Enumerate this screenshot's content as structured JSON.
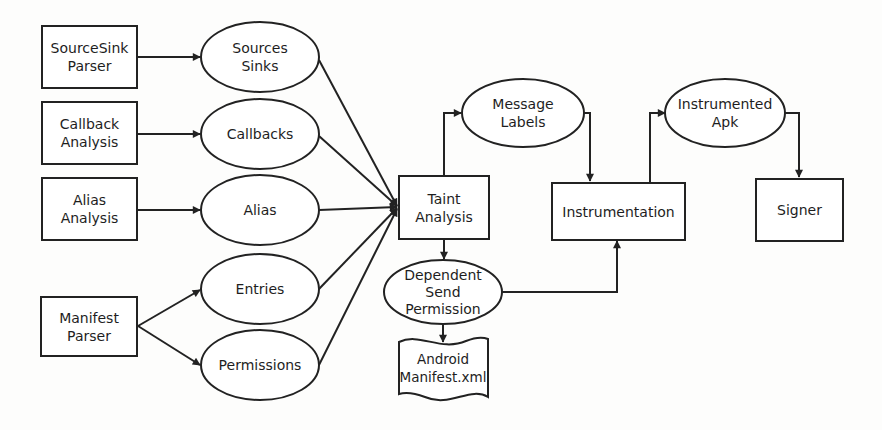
{
  "diagram": {
    "title": "",
    "colors": {
      "stroke": "#222222",
      "text": "#1e1e1e",
      "background": "#fdfdfc"
    },
    "nodes": {
      "sourcesink_parser": {
        "label": "SourceSink\nParser",
        "shape": "rectangle"
      },
      "callback_analysis": {
        "label": "Callback\nAnalysis",
        "shape": "rectangle"
      },
      "alias_analysis": {
        "label": "Alias\nAnalysis",
        "shape": "rectangle"
      },
      "manifest_parser": {
        "label": "Manifest\nParser",
        "shape": "rectangle"
      },
      "sources_sinks": {
        "label": "Sources\nSinks",
        "shape": "ellipse"
      },
      "callbacks": {
        "label": "Callbacks",
        "shape": "ellipse"
      },
      "alias": {
        "label": "Alias",
        "shape": "ellipse"
      },
      "entries": {
        "label": "Entries",
        "shape": "ellipse"
      },
      "permissions": {
        "label": "Permissions",
        "shape": "ellipse"
      },
      "taint_analysis": {
        "label": "Taint\nAnalysis",
        "shape": "rectangle"
      },
      "message_labels": {
        "label": "Message\nLabels",
        "shape": "ellipse"
      },
      "dependent_send_permission": {
        "label": "Dependent\nSend\nPermission",
        "shape": "ellipse"
      },
      "android_manifest": {
        "label": "Android\nManifest.xml",
        "shape": "document"
      },
      "instrumentation": {
        "label": "Instrumentation",
        "shape": "rectangle"
      },
      "instrumented_apk": {
        "label": "Instrumented\nApk",
        "shape": "ellipse"
      },
      "signer": {
        "label": "Signer",
        "shape": "rectangle"
      }
    },
    "edges": [
      {
        "from": "SourceSink Parser",
        "to": "Sources Sinks"
      },
      {
        "from": "Callback Analysis",
        "to": "Callbacks"
      },
      {
        "from": "Alias Analysis",
        "to": "Alias"
      },
      {
        "from": "Manifest Parser",
        "to": "Entries"
      },
      {
        "from": "Manifest Parser",
        "to": "Permissions"
      },
      {
        "from": "Sources Sinks",
        "to": "Taint Analysis"
      },
      {
        "from": "Callbacks",
        "to": "Taint Analysis"
      },
      {
        "from": "Alias",
        "to": "Taint Analysis"
      },
      {
        "from": "Entries",
        "to": "Taint Analysis"
      },
      {
        "from": "Permissions",
        "to": "Taint Analysis"
      },
      {
        "from": "Taint Analysis",
        "to": "Message Labels"
      },
      {
        "from": "Taint Analysis",
        "to": "Dependent Send Permission"
      },
      {
        "from": "Dependent Send Permission",
        "to": "Android Manifest.xml"
      },
      {
        "from": "Dependent Send Permission",
        "to": "Instrumentation"
      },
      {
        "from": "Message Labels",
        "to": "Instrumentation"
      },
      {
        "from": "Instrumentation",
        "to": "Instrumented Apk"
      },
      {
        "from": "Instrumented Apk",
        "to": "Signer"
      }
    ]
  }
}
